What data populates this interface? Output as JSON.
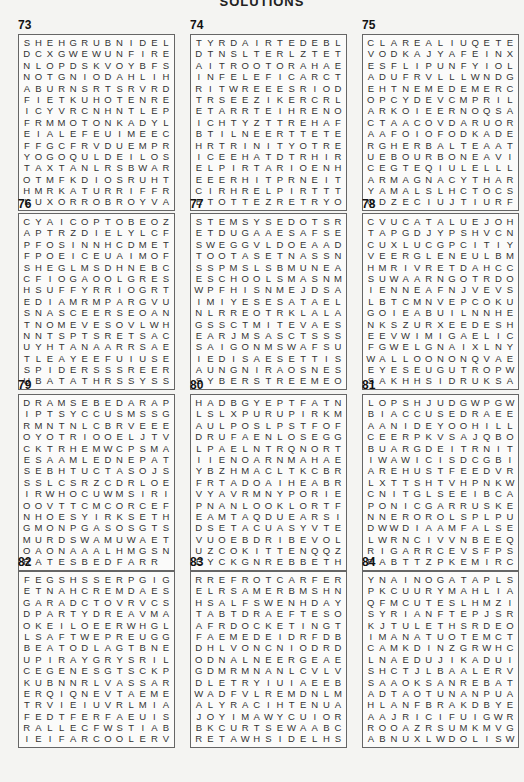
{
  "page": {
    "title": "SOLUTIONS"
  },
  "puzzles": [
    {
      "number": "73",
      "rows": [
        "SHEHGRUBNIDEL",
        "DCXGWEWUNFIRE",
        "NLOPDSKVOYBFS",
        "NOTGNIODAHLIH",
        "ABURNSRTSRVRD",
        "FIETKUHOTENRE",
        "ICYVRCNHNTLEP",
        "FRMMOTONKADYL",
        "EIALEFEUIMEEC",
        "FFGCFRVDUEMPR",
        "YOGOQULDEILOS",
        "TAXTANLRSBWAR",
        "OTMFKDIOSRUHT",
        "HMRKATURRIFFR",
        "LUXORROBROYVA"
      ]
    },
    {
      "number": "74",
      "rows": [
        "TYRDAIRTEDEBL",
        "DTNSLTERLZTET",
        "AITROOTORAHAE",
        "INFELEFICARCT",
        "RITWREEESRIOD",
        "TRSEEZIKERCRL",
        "ETARRTEIHRENO",
        "ICHTYZTTREHAF",
        "BTILNEERTTETE",
        "HRTRINITYOTRE",
        "ICEEHATDTRHIR",
        "ELPIRTARIOENH",
        "EEERHITPRNEIT",
        "CIRHRELPIRTTT",
        "ETOTTEZRETRYO"
      ]
    },
    {
      "number": "75",
      "rows": [
        "CLAREALIUQETE",
        "VODKAJYAFEINX",
        "ESFLIPUNFYIOL",
        "ADUFRVLLLWNDG",
        "EHTNEMEDEMERC",
        "OPCYDEVCMPRIL",
        "ARKOIEERNOQSA",
        "CTAACOVDARUOR",
        "AAFOIOFODKADE",
        "RGHERBALTEAAT",
        "UEBOURBONEAVI",
        "CEGTEQIULELLL",
        "ARMAGNACYTHAR",
        "YAMALSLHCTOCS",
        "ODZECIUJTIURF"
      ]
    },
    {
      "number": "76",
      "rows": [
        "CYAICOPTOBEOZ",
        "APTRZDIELYLCF",
        "PFOSINNHCDMETB",
        "FPOEICEUAIMOF",
        "SHEGLMSDHNEBC",
        "CFIOGAOOLGRES",
        "HSUFFYRRIOGRT",
        "EDIAMRMPARGVU",
        "SNASCEERSEOAN",
        "TNOMEVESOVLWH",
        "NNTSPTSRETSAC",
        "UYHTANAARRSAE",
        "TLEAYEEFUIUSE",
        "SPIDERSSSREER",
        "UBATATHRSSYSS"
      ]
    },
    {
      "number": "77",
      "rows": [
        "STEMSYSEDOTSR",
        "ETDUGAAESAFSE",
        "SWEGGVLDOEAAD",
        "TOOTASETNASSN",
        "SSPMSLSBMUNEA",
        "ESCHOOLSMASNM",
        "WPFHISNMEJDSA",
        "IMIYESESATAEL",
        "NLRREOTRKLALA",
        "GSSCTMITEVAES",
        "EARJMSASCTSSS",
        "SAIGONMSWAFSU",
        "IEDISAESETTIS",
        "AUNGNIRAOSNES",
        "SYBERSTREEMEO"
      ]
    },
    {
      "number": "78",
      "rows": [
        "CVUCATALUEJOH",
        "TAPGDJYPSHVCN",
        "CUXLUCGPCITIY",
        "VEERGLENEULBM",
        "HMRIVRETDAHCC",
        "SUWAARNGOTRDO",
        "IENNEAFNJVEVS",
        "LBTCMNVEPCOKUO",
        "GOIEABUILNNHE",
        "NKSZURXEEDESH",
        "EEVWIMIGAELIC",
        "FGWELGNAIXLNY",
        "WALLOONONQVAE",
        "EYESEUGUTROPW",
        "SAKHHSIDRUKSA"
      ]
    },
    {
      "number": "79",
      "rows": [
        "DRAMSEBEDARAP",
        "IPTSYCCUSMSS",
        "GRMNTNLCBRVEE",
        "EOYOTRIOOELJT",
        "VCKTRHEMWCPSM",
        "AESAAMLEDNEPA",
        "TSEBHTUCTASOJ",
        "SSSLCSRZCDRLO",
        "EIRWHOCUWMSIR",
        "IOOVTTCMCORCE",
        "FNHOESYIRKSET",
        "HGMONPGASOSGT",
        "SMURDSWAMUWAE",
        "TOAONAAALHMGS",
        "NRATESBEDFARR"
      ]
    },
    {
      "number": "80",
      "rows": [
        "HADBGYEPTFATN",
        "LSLXPURUPIRKM",
        "AULPOSLPSTFOF",
        "DRUFAENLOSEGG",
        "LPAELNTRQNORT",
        "IIENOARNMAHAE",
        "YBZHMACLTKCBR",
        "FRTADOAIHEABR",
        "VYAVRMNYPORIE",
        "PNANLOOKLORTF",
        "EAMTAQDUEARSI",
        "DSETACUASYVTE",
        "VUOEBDRIBEVOL",
        "UZCOKITTENQQZ",
        "EYCKGNREBBETH"
      ]
    },
    {
      "number": "81",
      "rows": [
        "LOPSHJUDGWPGW",
        "BIACCUSEDRAEE",
        "AANIDEYOOHILL",
        "CEERPKVSAJQBO",
        "BUARGDEITRNIT",
        "IWAWICISDCGBI",
        "AREHUSTFEEDVR",
        "LXTTSHTVHPNKW",
        "CNITGLSEEIBCA",
        "PONICGARRUSKE",
        "NNEROROLSPLPU",
        "DWWDIAAMFALSE",
        "LWRNCIVVNBEEQ",
        "RIGARRCEVSFPS",
        "RABTTZPKEMIRC"
      ]
    },
    {
      "number": "82",
      "rows": [
        "FEGSHSSERPGIG",
        "ETNAHCREMDAES",
        "GARADCTOVRVCS",
        "DPARTYDREAVMA",
        "OKEILOEERWHGL",
        "LSAFTWEPREUGG",
        "BEATODLAGTBNE",
        "UPIRAYGRYSRIL",
        "CEGENESGTSCKP",
        "KUBNNRLVASSAR",
        "ERQIQNEVTAEME",
        "TRVIEIUVRLMIA",
        "FEDTFERFAEUIS",
        "RALLECFWSTIAB",
        "IEIFARCOOLERV"
      ]
    },
    {
      "number": "83",
      "rows": [
        "RREFROTCARFER",
        "ELRSAMERBMSHN",
        "HSALFSWENHDAY",
        "TABTDRAEFTESO",
        "AFRDOCKETINGT",
        "FAEMEDEIDRFDB",
        "DHLVONCNIODRD",
        "ODNALNEERGEAE",
        "GDMRMNANLCVLV",
        "DLETRYIUIAEEB",
        "WADFVLREMDNLM",
        "ALYRACIHTENUA",
        "JOYIMAWYCUIOR",
        "BKCURTSEWAABC",
        "RETAWHSIDELHS"
      ]
    },
    {
      "number": "84",
      "rows": [
        "YNAINOGATAPLS",
        "PKCUURYMAHLIA",
        "QFMCUTESLHMZI",
        "SYRIANFTEPJSR",
        "KJTULETHSRDEO",
        "IMANATUOTEMCT",
        "CAMKDINZGRWHC",
        "LNAEDUJIKADUI",
        "SHCTJLBAALERV",
        "SAAOKSANREBAT",
        "ADTAOTUNANPUA",
        "HLANFBRAKDBYE",
        "AAJRICIFUIGWR",
        "ROOAZRSUMKMVG",
        "ABNUXLWDOLISW"
      ]
    }
  ]
}
